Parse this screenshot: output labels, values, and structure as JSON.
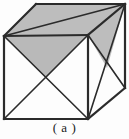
{
  "figure": {
    "caption": "( a )",
    "label": "a",
    "kind": "cube-diagram",
    "canvas": {
      "width": 129,
      "height": 139
    },
    "colors": {
      "background": "#fdfdfd",
      "stroke": "#2b2b2b",
      "shade_fill": "#b9b9b9",
      "shade_fill_light": "#c3c3c3",
      "caption_text": "#1b1b1b"
    },
    "stroke_width": 2,
    "vertices": {
      "front_top_left": [
        4,
        36
      ],
      "front_top_right": [
        88,
        35
      ],
      "front_bottom_left": [
        4,
        119
      ],
      "front_bottom_right": [
        88,
        119
      ],
      "back_top_left": [
        36,
        4
      ],
      "back_top_right": [
        125,
        4
      ],
      "back_bottom_right": [
        125,
        88
      ],
      "front_face_center": [
        46,
        78
      ],
      "right_face_center": [
        107,
        68
      ]
    },
    "edges": [
      {
        "name": "front-top-edge",
        "from": "front_top_left",
        "to": "front_top_right"
      },
      {
        "name": "front-left-edge",
        "from": "front_top_left",
        "to": "front_bottom_left"
      },
      {
        "name": "front-bottom-edge",
        "from": "front_bottom_left",
        "to": "front_bottom_right"
      },
      {
        "name": "front-right-edge",
        "from": "front_top_right",
        "to": "front_bottom_right"
      },
      {
        "name": "top-back-left-edge",
        "from": "front_top_left",
        "to": "back_top_left"
      },
      {
        "name": "top-back-edge",
        "from": "back_top_left",
        "to": "back_top_right"
      },
      {
        "name": "top-right-edge",
        "from": "back_top_right",
        "to": "front_top_right"
      },
      {
        "name": "right-back-vertical-edge",
        "from": "back_top_right",
        "to": "back_bottom_right"
      },
      {
        "name": "right-bottom-edge",
        "from": "back_bottom_right",
        "to": "front_bottom_right"
      }
    ],
    "diagonals": [
      {
        "name": "front-face-diagonal-1",
        "from": "front_top_left",
        "to": "front_bottom_right"
      },
      {
        "name": "front-face-diagonal-2",
        "from": "front_top_right",
        "to": "front_bottom_left"
      },
      {
        "name": "right-face-diagonal-1",
        "from": "front_top_right",
        "to": "back_bottom_right"
      },
      {
        "name": "right-face-diagonal-2",
        "from": "back_top_right",
        "to": "front_bottom_right"
      },
      {
        "name": "top-face-diagonal",
        "from": "back_top_right",
        "to": "front_top_left"
      }
    ],
    "shaded_regions": [
      {
        "name": "top-face-shade",
        "points": "4,36 36,4 125,4 88,35",
        "fill": "#bdbdbd"
      },
      {
        "name": "front-upper-triangle-shade",
        "points": "4,36 88,35 46,78",
        "fill": "#b9b9b9"
      },
      {
        "name": "right-upper-triangle-shade",
        "points": "88,35 125,4 107,68",
        "fill": "#bdbdbd"
      }
    ]
  }
}
